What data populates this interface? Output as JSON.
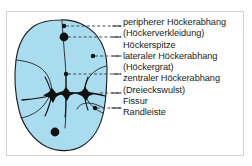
{
  "figure": {
    "colors": {
      "tooth_fill": "#a9dcee",
      "tooth_outline": "#1a1a1a",
      "fissure_line": "#111111",
      "marker": "#111111",
      "leader_line": "#3a3a3a",
      "frame_border": "#d2d2d2",
      "background": "#ffffff",
      "text": "#1b1b1b"
    }
  },
  "labels": [
    {
      "id": "peripherer-hoeckerabhang",
      "text": "peripherer Höckerabhang"
    },
    {
      "id": "hoeckerverkleidung",
      "text": "(Höckerverkleidung)"
    },
    {
      "id": "hoeckerspitze",
      "text": "Höckerspitze"
    },
    {
      "id": "lateraler-hoeckerabhang",
      "text": "lateraler Höckerabhang"
    },
    {
      "id": "hoeckergrat",
      "text": "(Höckergrat)"
    },
    {
      "id": "zentraler-hoeckerabhang",
      "text": "zentraler Höckerabhang"
    },
    {
      "id": "dreieckswulst",
      "text": "(Dreieckswulst)"
    },
    {
      "id": "fissur",
      "text": "Fissur"
    },
    {
      "id": "randleiste",
      "text": "Randleiste"
    }
  ],
  "callouts": [
    {
      "id": "callout-peripherer-hoeckerabhang",
      "marker": "small-dot",
      "target_label": "peripherer Höckerabhang"
    },
    {
      "id": "callout-hoeckerspitze",
      "marker": "large-dot",
      "target_label": "Höckerspitze"
    },
    {
      "id": "callout-lateraler-hoeckerabhang",
      "marker": "small-dot",
      "target_label": "lateraler Höckerabhang"
    },
    {
      "id": "callout-zentraler-hoeckerabhang",
      "marker": "small-dot",
      "target_label": "zentraler Höckerabhang"
    },
    {
      "id": "callout-fissur",
      "marker": "fissure-node",
      "target_label": "Fissur"
    },
    {
      "id": "callout-randleiste",
      "marker": "small-dot",
      "target_label": "Randleiste"
    }
  ]
}
